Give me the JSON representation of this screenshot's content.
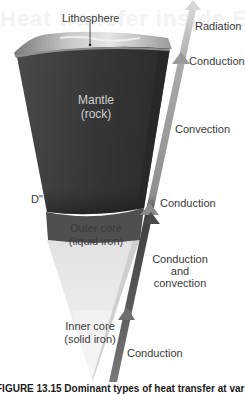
{
  "ghost_header": "Heat transfer inside Earth",
  "layers": [
    {
      "id": "lithosphere",
      "label": "Lithosphere"
    },
    {
      "id": "mantle",
      "label_line1": "Mantle",
      "label_line2": "(rock)"
    },
    {
      "id": "d_double_prime",
      "label": "D\""
    },
    {
      "id": "outer_core",
      "label_line1": "Outer core",
      "label_line2": "(liquid iron)"
    },
    {
      "id": "inner_core",
      "label_line1": "Inner core",
      "label_line2": "(solid iron)"
    }
  ],
  "heat_transfer": [
    {
      "region": "atmosphere",
      "label": "Radiation"
    },
    {
      "region": "lithosphere",
      "label": "Conduction"
    },
    {
      "region": "mantle",
      "label": "Convection"
    },
    {
      "region": "d_double_prime",
      "label": "Conduction"
    },
    {
      "region": "outer_core",
      "label_line1": "Conduction",
      "label_line2": "and",
      "label_line3": "convection"
    },
    {
      "region": "inner_core",
      "label": "Conduction"
    }
  ],
  "caption": "FIGURE 13.15  Dominant types of heat transfer at various depths",
  "colors": {
    "mantle": "#3c3c3c",
    "lithosphere": "#8a8a8a",
    "outer_core": "#e4e4e4",
    "inner_core": "#f1f1f1",
    "arrow_radiation": "#d4d4d4",
    "arrow_conduction_top": "#9a9a9a",
    "arrow_convection": "#a8a8a8",
    "arrow_outer_core": "#4a4a4a",
    "arrow_inner_core": "#6e6e6e"
  }
}
